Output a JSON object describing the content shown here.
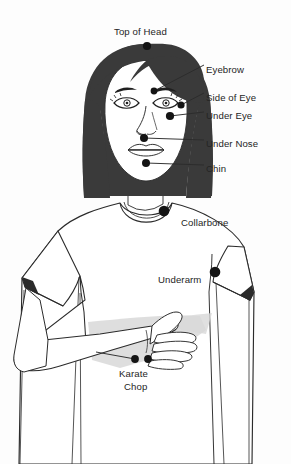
{
  "diagram": {
    "canvas": {
      "width": 291,
      "height": 464
    }
  },
  "colors": {
    "background": "#fdfdfd",
    "hair": "#3a3a3a",
    "skin": "#ffffff",
    "outline": "#2b2b2b",
    "point": "#141414",
    "leader_line": "#2b2b2b",
    "label_text": "#252525",
    "shadow": "#d8d8d8",
    "shirt": "#ffffff"
  },
  "points": [
    {
      "id": "top-of-head",
      "label": "Top of Head",
      "x": 147,
      "y": 46,
      "r": 4.1
    },
    {
      "id": "eyebrow",
      "label": "Eyebrow",
      "x": 154,
      "y": 91,
      "r": 3.4
    },
    {
      "id": "side-of-eye",
      "label": "Side of Eye",
      "x": 181,
      "y": 105,
      "r": 3.6
    },
    {
      "id": "under-eye",
      "label": "Under Eye",
      "x": 170,
      "y": 116,
      "r": 4.1
    },
    {
      "id": "under-nose",
      "label": "Under Nose",
      "x": 144,
      "y": 138,
      "r": 4.0
    },
    {
      "id": "chin",
      "label": "Chin",
      "x": 146,
      "y": 163,
      "r": 4.0
    },
    {
      "id": "collarbone",
      "label": "Collarbone",
      "x": 164,
      "y": 211,
      "r": 5.3
    },
    {
      "id": "underarm",
      "label": "Underarm",
      "x": 215,
      "y": 272,
      "r": 5.3
    },
    {
      "id": "karate-chop-1",
      "label": "Karate Chop",
      "x": 135,
      "y": 359,
      "r": 3.9
    },
    {
      "id": "karate-chop-2",
      "label": "Karate Chop",
      "x": 148,
      "y": 359,
      "r": 3.9
    }
  ],
  "labels": {
    "top_of_head": {
      "text": "Top of Head",
      "x": 114,
      "y": 26
    },
    "eyebrow": {
      "text": "Eyebrow",
      "x": 206,
      "y": 64
    },
    "side_of_eye": {
      "text": "Side of Eye",
      "x": 206,
      "y": 92
    },
    "under_eye": {
      "text": "Under Eye",
      "x": 206,
      "y": 110
    },
    "under_nose": {
      "text": "Under Nose",
      "x": 206,
      "y": 138
    },
    "chin": {
      "text": "Chin",
      "x": 206,
      "y": 163
    },
    "collarbone": {
      "text": "Collarbone",
      "x": 181,
      "y": 217
    },
    "underarm": {
      "text": "Underarm",
      "x": 158,
      "y": 274
    },
    "karate_chop_line1": {
      "text": "Karate",
      "x": 119,
      "y": 368
    },
    "karate_chop_line2": {
      "text": "Chop",
      "x": 124,
      "y": 381
    }
  }
}
